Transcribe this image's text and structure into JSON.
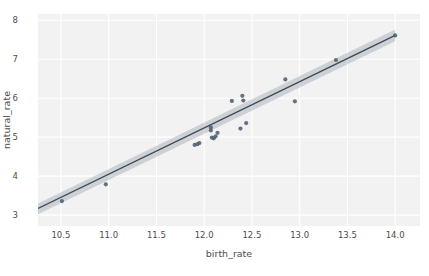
{
  "chart_data": {
    "type": "scatter",
    "title": "",
    "xlabel": "birth_rate",
    "ylabel": "natural_rate",
    "xlim": [
      10.26,
      14.26
    ],
    "ylim": [
      2.72,
      8.16
    ],
    "xticks": [
      "10.5",
      "11.0",
      "11.5",
      "12.0",
      "12.5",
      "13.0",
      "13.5",
      "14.0"
    ],
    "xtick_values": [
      10.5,
      11.0,
      11.5,
      12.0,
      12.5,
      13.0,
      13.5,
      14.0
    ],
    "yticks": [
      "3",
      "4",
      "5",
      "6",
      "7",
      "8"
    ],
    "ytick_values": [
      3,
      4,
      5,
      6,
      7,
      8
    ],
    "grid": true,
    "legend": "none",
    "points": [
      {
        "x": 10.51,
        "y": 3.36
      },
      {
        "x": 10.97,
        "y": 3.79
      },
      {
        "x": 11.9,
        "y": 4.8
      },
      {
        "x": 11.93,
        "y": 4.82
      },
      {
        "x": 11.95,
        "y": 4.85
      },
      {
        "x": 12.07,
        "y": 5.25
      },
      {
        "x": 12.07,
        "y": 5.17
      },
      {
        "x": 12.08,
        "y": 4.99
      },
      {
        "x": 12.1,
        "y": 4.97
      },
      {
        "x": 12.12,
        "y": 5.02
      },
      {
        "x": 12.14,
        "y": 5.11
      },
      {
        "x": 12.29,
        "y": 5.93
      },
      {
        "x": 12.38,
        "y": 5.22
      },
      {
        "x": 12.4,
        "y": 6.06
      },
      {
        "x": 12.41,
        "y": 5.94
      },
      {
        "x": 12.44,
        "y": 5.36
      },
      {
        "x": 12.85,
        "y": 6.48
      },
      {
        "x": 12.95,
        "y": 5.92
      },
      {
        "x": 13.38,
        "y": 6.98
      },
      {
        "x": 14.0,
        "y": 7.61
      }
    ],
    "regression": {
      "x_start": 10.26,
      "x_end": 14.0,
      "y_start": 3.17,
      "y_end": 7.61,
      "band_upper_start": 3.3,
      "band_lower_start": 3.02,
      "band_upper_end": 7.76,
      "band_lower_end": 7.46
    },
    "colors": {
      "panel_background": "#f2f2f2",
      "grid": "#ffffff",
      "point": "#4c5c6e",
      "line": "#3d4a57",
      "band": "#9aa3ad",
      "text": "#4d4d4d"
    }
  }
}
